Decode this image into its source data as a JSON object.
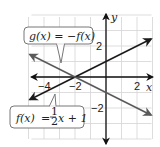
{
  "chart_data": {
    "type": "line",
    "title": "",
    "xlabel": "x",
    "ylabel": "y",
    "xlim": [
      -5,
      3
    ],
    "ylim": [
      -4,
      4
    ],
    "grid": true,
    "x_ticks": [
      {
        "value": -4,
        "label": "−4"
      },
      {
        "value": -2,
        "label": "−2"
      },
      {
        "value": 2,
        "label": "2"
      }
    ],
    "y_ticks": [
      {
        "value": 2,
        "label": "2"
      },
      {
        "value": -2,
        "label": "−2"
      }
    ],
    "series": [
      {
        "name": "f",
        "label_parts": {
          "lhs": "f(x)",
          "eq": "=",
          "num": "1",
          "den": "2",
          "rest": "x + 1"
        },
        "slope": 0.5,
        "intercept": 1,
        "x_range": [
          -4.9,
          2.9
        ],
        "color": "#1a1a1a"
      },
      {
        "name": "g",
        "label": "g(x) = −f(x)",
        "slope": -0.5,
        "intercept": -1,
        "x_range": [
          -4.9,
          2.9
        ],
        "color": "#5a5a5a"
      }
    ],
    "annotations": [
      {
        "text": "g(x) = −f(x)",
        "points_to": "g"
      },
      {
        "text": "f(x) = ½x + 1",
        "points_to": "f"
      }
    ]
  }
}
